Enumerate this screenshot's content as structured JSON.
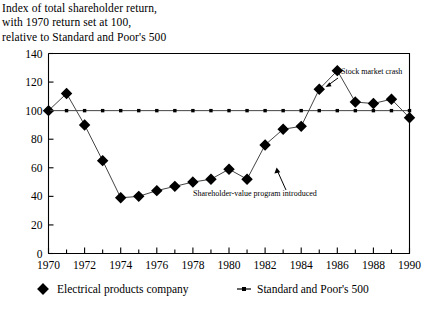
{
  "title": {
    "line1": "Index of total shareholder return,",
    "line2": "with 1970 return set at 100,",
    "line3": "relative to Standard and Poor's 500"
  },
  "annotations": [
    {
      "id": "stock-market-crash",
      "text": "Stock market crash",
      "x": 1986,
      "y": 128
    },
    {
      "id": "shareholder-value-program",
      "text": "Shareholder-value program introduced",
      "x": 1983,
      "y": 76
    }
  ],
  "legend": {
    "position": "bottom",
    "items": [
      {
        "id": "electrical-products-company",
        "label": "Electrical products company",
        "marker": "diamond",
        "color": "#000000"
      },
      {
        "id": "standard-and-poors-500",
        "label": "Standard and Poor's 500",
        "marker": "dash-square",
        "color": "#000000"
      }
    ]
  },
  "chart_data": {
    "type": "line",
    "title": "Index of total shareholder return, with 1970 return set at 100, relative to Standard and Poor's 500",
    "xlabel": "",
    "ylabel": "",
    "xlim": [
      1970,
      1990
    ],
    "ylim": [
      0,
      140
    ],
    "yticks": [
      0,
      20,
      40,
      60,
      80,
      100,
      120,
      140
    ],
    "xticks": [
      1970,
      1972,
      1974,
      1976,
      1978,
      1980,
      1982,
      1984,
      1986,
      1988,
      1990
    ],
    "xtick_minor": [
      1971,
      1973,
      1975,
      1977,
      1979,
      1981,
      1983,
      1985,
      1987,
      1989
    ],
    "grid": false,
    "x": [
      1970,
      1971,
      1972,
      1973,
      1974,
      1975,
      1976,
      1977,
      1978,
      1979,
      1980,
      1981,
      1982,
      1983,
      1984,
      1985,
      1986,
      1987,
      1988,
      1989,
      1990
    ],
    "series": [
      {
        "name": "Electrical products company",
        "marker": "diamond",
        "values": [
          100,
          112,
          90,
          65,
          39,
          40,
          44,
          47,
          50,
          52,
          59,
          52,
          76,
          87,
          89,
          115,
          128,
          106,
          105,
          108,
          95
        ]
      },
      {
        "name": "Standard and Poor's 500",
        "marker": "dash-square",
        "values": [
          100,
          100,
          100,
          100,
          100,
          100,
          100,
          100,
          100,
          100,
          100,
          100,
          100,
          100,
          100,
          100,
          100,
          100,
          100,
          100,
          100
        ]
      }
    ]
  }
}
